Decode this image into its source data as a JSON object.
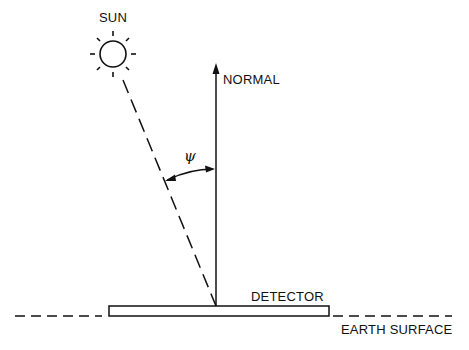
{
  "diagram": {
    "labels": {
      "sun": "SUN",
      "normal": "NORMAL",
      "angle": "ψ",
      "detector": "DETECTOR",
      "earth_surface": "EARTH SURFACE"
    },
    "colors": {
      "stroke": "#111111",
      "background": "#ffffff"
    }
  }
}
